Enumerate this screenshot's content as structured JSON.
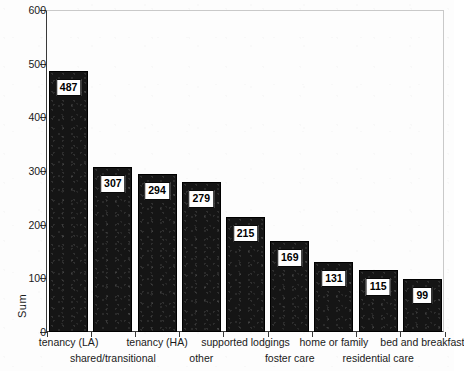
{
  "chart_data": {
    "type": "bar",
    "title": "",
    "xlabel": "",
    "ylabel": "Sum",
    "ylim": [
      0,
      600
    ],
    "yticks": [
      0,
      100,
      200,
      300,
      400,
      500,
      600
    ],
    "grid": false,
    "legend": null,
    "categories": [
      "tenancy (LA)",
      "shared/transitional",
      "tenancy (HA)",
      "other",
      "supported lodgings",
      "foster care",
      "home or family",
      "residential care",
      "bed and breakfast"
    ],
    "values": [
      487,
      307,
      294,
      279,
      215,
      169,
      131,
      115,
      99
    ],
    "bar_color": "#151515",
    "label_box_color": "#ffffff"
  },
  "axes": {
    "y_title": "Sum",
    "y_tick_labels": [
      "600",
      "500",
      "400",
      "300",
      "200",
      "100",
      "0"
    ],
    "x_tick_labels_row1": [
      "tenancy (LA)",
      "tenancy (HA)",
      "supported lodgings",
      "home or family",
      "bed and breakfast"
    ],
    "x_tick_labels_row2": [
      "shared/transitional",
      "other",
      "foster care",
      "residential care"
    ]
  },
  "data_labels": [
    "487",
    "307",
    "294",
    "279",
    "215",
    "169",
    "131",
    "115",
    "99"
  ]
}
